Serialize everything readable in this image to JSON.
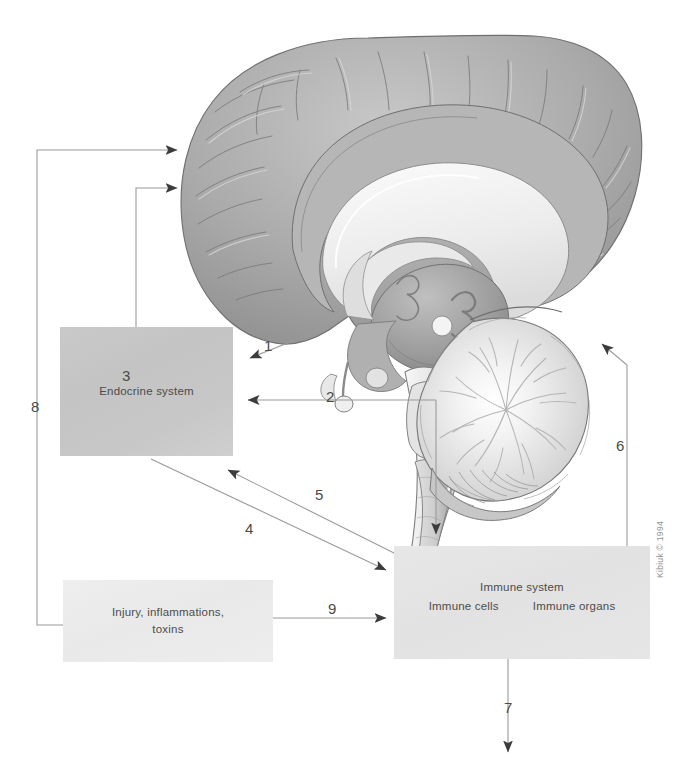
{
  "figure": {
    "credit": "Kibiuk © 1994",
    "background_color": "#ffffff"
  },
  "boxes": [
    {
      "id": "endocrine",
      "label": "Endocrine system",
      "fill": "#c7c7c7",
      "x": 60,
      "y": 327,
      "w": 173,
      "h": 129
    },
    {
      "id": "injury",
      "label": "Injury, inflammations,\ntoxins",
      "fill": "#ebebeb",
      "x": 63,
      "y": 580,
      "w": 210,
      "h": 82
    },
    {
      "id": "immune",
      "label": "Immune system",
      "sub_left": "Immune cells",
      "sub_right": "Immune organs",
      "fill": "#e4e4e4",
      "x": 394,
      "y": 546,
      "w": 256,
      "h": 113
    }
  ],
  "illustration": {
    "name": "midsagittal-brain",
    "parts": [
      "cerebral cortex",
      "corpus callosum",
      "thalamus",
      "hypothalamus",
      "pituitary gland",
      "brainstem",
      "cerebellum",
      "spinal cord"
    ],
    "palette": {
      "cortex": "#a6a6a6",
      "cortex_light": "#c4c4c4",
      "white_matter": "#f0f0f0",
      "deep_gray": "#8f8f8f",
      "outline": "#6e6e6e"
    }
  },
  "connectors": [
    {
      "id": "c1",
      "number": "1",
      "label_x": 264,
      "label_y": 338,
      "from": "brain-hypothalamus",
      "to": "endocrine-box"
    },
    {
      "id": "c2",
      "number": "2",
      "label_x": 326,
      "label_y": 389,
      "from": "brainstem",
      "to": "endocrine-box"
    },
    {
      "id": "c3",
      "number": "3",
      "label_x": 122,
      "label_y": 368,
      "from": "endocrine-box",
      "to": "brain-cortex"
    },
    {
      "id": "c4",
      "number": "4",
      "label_x": 245,
      "label_y": 521,
      "from": "endocrine-box",
      "to": "immune-box"
    },
    {
      "id": "c5",
      "number": "5",
      "label_x": 315,
      "label_y": 487,
      "from": "immune-box",
      "to": "endocrine-box"
    },
    {
      "id": "c6",
      "number": "6",
      "label_x": 616,
      "label_y": 438,
      "from": "immune-box",
      "to": "brain-cerebellum"
    },
    {
      "id": "c7",
      "number": "7",
      "label_x": 504,
      "label_y": 700,
      "from": "immune-box",
      "to": "outward"
    },
    {
      "id": "c8",
      "number": "8",
      "label_x": 31,
      "label_y": 399,
      "from": "injury-box",
      "to": "brain-cortex"
    },
    {
      "id": "c9",
      "number": "9",
      "label_x": 328,
      "label_y": 601,
      "from": "injury-box",
      "to": "immune-box"
    }
  ],
  "colors": {
    "line": "#9a9a9a",
    "arrowhead": "#3c3c3c",
    "text": "#4c4c4c",
    "number": "#4a4a4a",
    "credit": "#8f8f8f"
  }
}
